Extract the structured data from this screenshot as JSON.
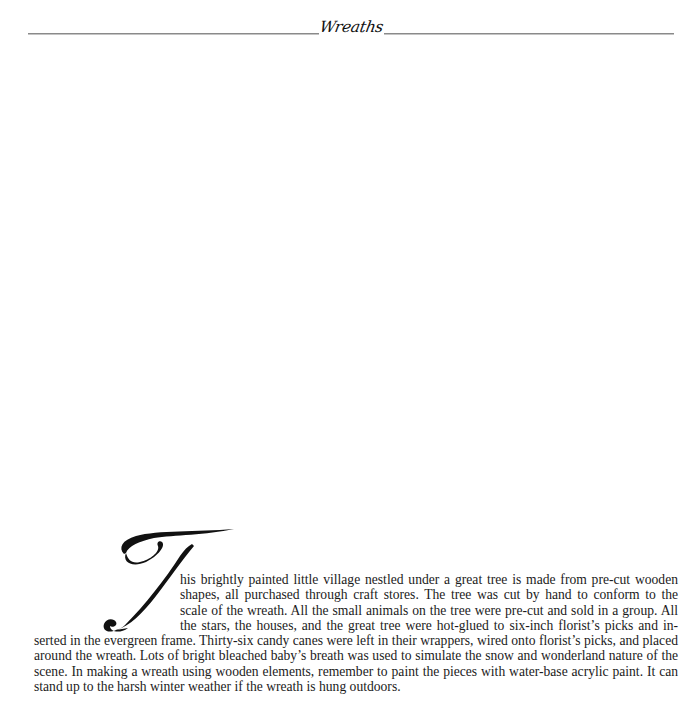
{
  "header": {
    "section_title": "Wreaths"
  },
  "dropcap": {
    "letter": "T",
    "icon": "script-T-initial"
  },
  "paragraph": {
    "lines": [
      "his brightly painted little village nestled under a great tree is made from pre-cut wooden",
      "shapes, all purchased through craft stores. The tree was cut by hand to conform to the",
      "scale of the wreath. All the small animals on the tree were pre-cut and sold in a group. All",
      "the stars, the houses, and the great tree were hot-glued to six-inch florist’s picks and in-",
      "serted in the evergreen frame. Thirty-six candy canes were left in their wrappers, wired onto florist’s picks, and placed",
      "around the wreath. Lots of bright bleached baby’s breath was used to simulate the snow and wonderland nature of the",
      "scene.  In making a wreath using wooden elements, remember to paint the pieces with water-base acrylic paint. It can",
      "stand up to the harsh winter weather if the wreath is hung outdoors."
    ]
  }
}
